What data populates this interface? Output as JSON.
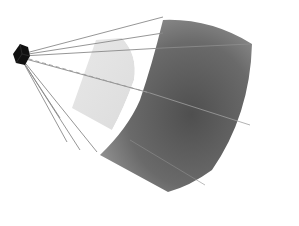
{
  "diagram": {
    "type": "projection-illustration",
    "colors": {
      "background": "#ffffff",
      "camera": "#111111",
      "screen_dark": "#555555",
      "screen_mid": "#7a7a7a",
      "screen_light": "#9a9a9a",
      "band": "#e4e4e4",
      "ray": "#8a8a8a"
    },
    "camera": {
      "x": 20,
      "y": 55
    },
    "rays": [
      {
        "x2": 163,
        "y2": 17
      },
      {
        "x2": 163,
        "y2": 33
      },
      {
        "x2": 163,
        "y2": 48
      },
      {
        "x2": 250,
        "y2": 125
      },
      {
        "x2": 97,
        "y2": 152
      },
      {
        "x2": 80,
        "y2": 150
      },
      {
        "x2": 67,
        "y2": 142
      },
      {
        "x2": 62,
        "y2": 118
      }
    ],
    "dashed_ray": {
      "x2": 148,
      "y2": 93
    }
  }
}
